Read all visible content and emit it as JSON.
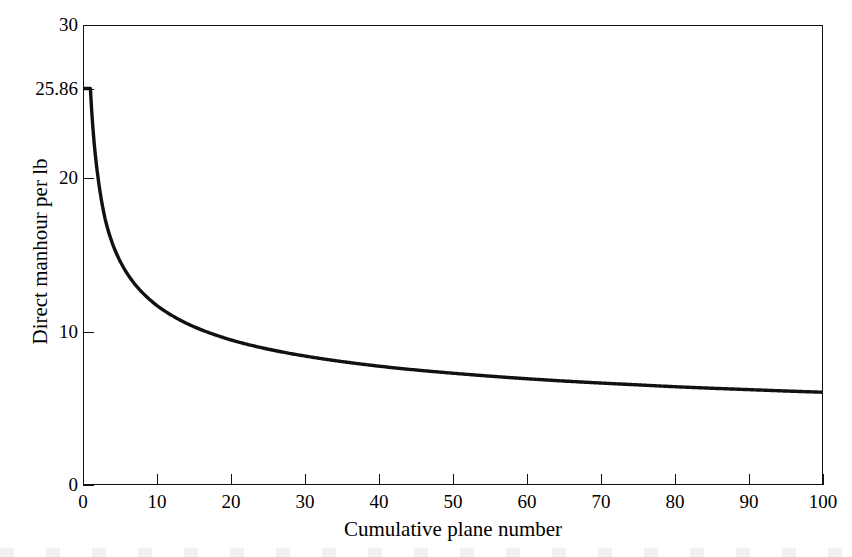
{
  "chart_data": {
    "type": "line",
    "title": "",
    "subtitle": "",
    "xlabel": "Cumulative plane number",
    "ylabel": "Direct manhour per lb",
    "xlim": [
      0,
      100
    ],
    "ylim": [
      0,
      30
    ],
    "grid": false,
    "legend": null,
    "x_ticks": [
      0,
      10,
      20,
      30,
      40,
      50,
      60,
      70,
      80,
      90,
      100
    ],
    "x_tick_labels": [
      "0",
      "10",
      "20",
      "30",
      "40",
      "50",
      "60",
      "70",
      "80",
      "90",
      "100"
    ],
    "y_ticks": [
      0,
      10,
      20,
      25.86,
      30
    ],
    "y_tick_labels": [
      "0",
      "10",
      "20",
      "25.86",
      "30"
    ],
    "annotations": [
      {
        "label": "25.86",
        "description": "first-unit direct manhour per lb marked on y axis",
        "value": 25.86
      }
    ],
    "series": [
      {
        "name": "Learning curve",
        "color": "#111111",
        "x": [
          1,
          2,
          3,
          4,
          5,
          6,
          7,
          8,
          9,
          10,
          12,
          14,
          16,
          18,
          20,
          25,
          30,
          35,
          40,
          45,
          50,
          55,
          60,
          65,
          70,
          75,
          80,
          85,
          90,
          95,
          100
        ],
        "y": [
          25.86,
          20.16,
          17.33,
          15.72,
          14.61,
          13.77,
          13.1,
          12.56,
          12.1,
          11.7,
          11.06,
          10.54,
          10.12,
          9.77,
          9.46,
          8.86,
          8.41,
          8.05,
          7.75,
          7.5,
          7.29,
          7.1,
          6.93,
          6.78,
          6.65,
          6.53,
          6.41,
          6.31,
          6.22,
          6.13,
          6.05
        ]
      }
    ]
  },
  "axes": {
    "y_label": "Direct manhour per lb",
    "x_label": "Cumulative plane number",
    "y_tick_labels": [
      "30",
      "25.86",
      "20",
      "10",
      "0"
    ],
    "x_tick_labels": [
      "0",
      "10",
      "20",
      "30",
      "40",
      "50",
      "60",
      "70",
      "80",
      "90",
      "100"
    ]
  },
  "style": {
    "line_color": "#111111",
    "axis_color": "#111111",
    "background": "#ffffff"
  }
}
